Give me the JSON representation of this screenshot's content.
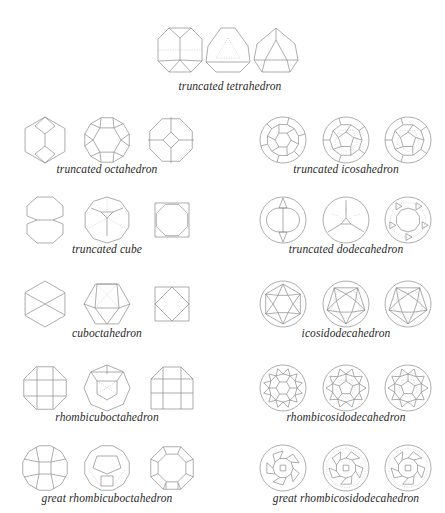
{
  "diagram": {
    "line_color": "#8a8a8a",
    "hidden_line_color": "#b9b9b9",
    "text_color": "#2a2a2a",
    "groups": [
      {
        "id": "truncated-tetrahedron",
        "label": "truncated tetrahedron",
        "label_pos": [
          230,
          89
        ],
        "views": [
          [
            180,
            50,
            "ttet-a"
          ],
          [
            228,
            50,
            "ttet-b"
          ],
          [
            276,
            50,
            "ttet-c"
          ]
        ]
      },
      {
        "id": "truncated-octahedron",
        "label": "truncated octahedron",
        "label_pos": [
          107,
          172
        ],
        "views": [
          [
            45,
            140,
            "toct-a"
          ],
          [
            107,
            140,
            "toct-b"
          ],
          [
            171,
            140,
            "toct-c"
          ]
        ]
      },
      {
        "id": "truncated-icosahedron",
        "label": "truncated icosahedron",
        "label_pos": [
          346,
          172
        ],
        "views": [
          [
            283,
            140,
            "tico-a"
          ],
          [
            346,
            140,
            "tico-b"
          ],
          [
            408,
            140,
            "tico-c"
          ]
        ]
      },
      {
        "id": "truncated-cube",
        "label": "truncated cube",
        "label_pos": [
          107,
          252
        ],
        "views": [
          [
            45,
            220,
            "tcub-a"
          ],
          [
            107,
            220,
            "tcub-b"
          ],
          [
            172,
            220,
            "tcub-c"
          ]
        ]
      },
      {
        "id": "truncated-dodecahedron",
        "label": "truncated dodecahedron",
        "label_pos": [
          346,
          252
        ],
        "views": [
          [
            283,
            220,
            "tdod-a"
          ],
          [
            346,
            220,
            "tdod-b"
          ],
          [
            408,
            220,
            "tdod-c"
          ]
        ]
      },
      {
        "id": "cuboctahedron",
        "label": "cuboctahedron",
        "label_pos": [
          107,
          336
        ],
        "views": [
          [
            45,
            304,
            "cub-a"
          ],
          [
            107,
            304,
            "cub-b"
          ],
          [
            172,
            304,
            "cub-c"
          ]
        ]
      },
      {
        "id": "icosidodecahedron",
        "label": "icosidodecahedron",
        "label_pos": [
          346,
          336
        ],
        "views": [
          [
            283,
            304,
            "icd-a"
          ],
          [
            346,
            304,
            "icd-b"
          ],
          [
            408,
            304,
            "icd-c"
          ]
        ]
      },
      {
        "id": "rhombicuboctahedron",
        "label": "rhombicuboctahedron",
        "label_pos": [
          107,
          420
        ],
        "views": [
          [
            45,
            388,
            "rco-a"
          ],
          [
            107,
            388,
            "rco-b"
          ],
          [
            172,
            388,
            "rco-c"
          ]
        ]
      },
      {
        "id": "rhombicosidodecahedron",
        "label": "rhombicosidodecahedron",
        "label_pos": [
          346,
          420
        ],
        "views": [
          [
            283,
            388,
            "rid-a"
          ],
          [
            346,
            388,
            "rid-b"
          ],
          [
            408,
            388,
            "rid-c"
          ]
        ]
      },
      {
        "id": "great-rhombicuboctahedron",
        "label": "great rhombicuboctahedron",
        "label_pos": [
          107,
          501
        ],
        "views": [
          [
            45,
            468,
            "grco-a"
          ],
          [
            107,
            468,
            "grco-b"
          ],
          [
            172,
            468,
            "grco-c"
          ]
        ]
      },
      {
        "id": "great-rhombicosidodecahedron",
        "label": "great rhombicosidodecahedron",
        "label_pos": [
          346,
          501
        ],
        "views": [
          [
            283,
            468,
            "grid-a"
          ],
          [
            346,
            468,
            "grid-b"
          ],
          [
            408,
            468,
            "grid-c"
          ]
        ]
      }
    ]
  }
}
